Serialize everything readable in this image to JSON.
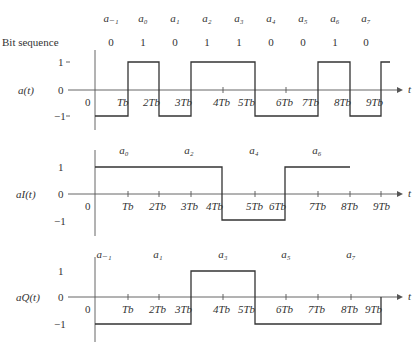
{
  "header": {
    "bit_sequence_label": "Bit sequence",
    "symbols": [
      "a₋₁",
      "a₀",
      "a₁",
      "a₂",
      "a₃",
      "a₄",
      "a₅",
      "a₆",
      "a₇"
    ],
    "bits": [
      "0",
      "1",
      "0",
      "1",
      "1",
      "0",
      "0",
      "1",
      "0"
    ]
  },
  "plots": [
    {
      "id": "a",
      "ylabel": "a(t)",
      "levels": {
        "high": "1",
        "zero": "0",
        "low": "−1"
      },
      "origin_label": "0",
      "tick_labels": [
        "Tb",
        "2Tb",
        "3Tb",
        "4Tb",
        "5Tb",
        "6Tb",
        "7Tb",
        "8Tb",
        "9Tb"
      ],
      "axis_var": "t",
      "segments": [
        {
          "from": 0,
          "to": 1,
          "level": -1
        },
        {
          "from": 1,
          "to": 2,
          "level": 1
        },
        {
          "from": 2,
          "to": 3,
          "level": -1
        },
        {
          "from": 3,
          "to": 5,
          "level": 1
        },
        {
          "from": 5,
          "to": 7,
          "level": -1
        },
        {
          "from": 7,
          "to": 8,
          "level": 1
        },
        {
          "from": 8,
          "to": 9,
          "level": -1
        },
        {
          "from": 9,
          "to": 9.3,
          "level": 1
        }
      ]
    },
    {
      "id": "aI",
      "ylabel": "aI(t)",
      "levels": {
        "high": "1",
        "zero": "0",
        "low": "−1"
      },
      "origin_label": "0",
      "tick_labels": [
        "Tb",
        "2Tb",
        "3Tb",
        "4Tb",
        "5Tb",
        "6Tb",
        "7Tb",
        "8Tb",
        "9Tb"
      ],
      "axis_var": "t",
      "symbols": [
        "a₀",
        "a₂",
        "a₄",
        "a₆"
      ],
      "segments": [
        {
          "from": 0,
          "to": 4,
          "level": 1
        },
        {
          "from": 4,
          "to": 6,
          "level": -1
        },
        {
          "from": 6,
          "to": 8,
          "level": 1
        }
      ]
    },
    {
      "id": "aQ",
      "ylabel": "aQ(t)",
      "levels": {
        "high": "1",
        "zero": "0",
        "low": "−1"
      },
      "origin_label": "0",
      "tick_labels": [
        "Tb",
        "2Tb",
        "3Tb",
        "4Tb",
        "5Tb",
        "6Tb",
        "7Tb",
        "8Tb",
        "9Tb"
      ],
      "axis_var": "t",
      "symbols": [
        "a₋₁",
        "a₁",
        "a₃",
        "a₅",
        "a₇"
      ],
      "segments": [
        {
          "from": 0,
          "to": 3,
          "level": -1
        },
        {
          "from": 3,
          "to": 5,
          "level": 1
        },
        {
          "from": 5,
          "to": 9,
          "level": -1
        }
      ]
    }
  ]
}
